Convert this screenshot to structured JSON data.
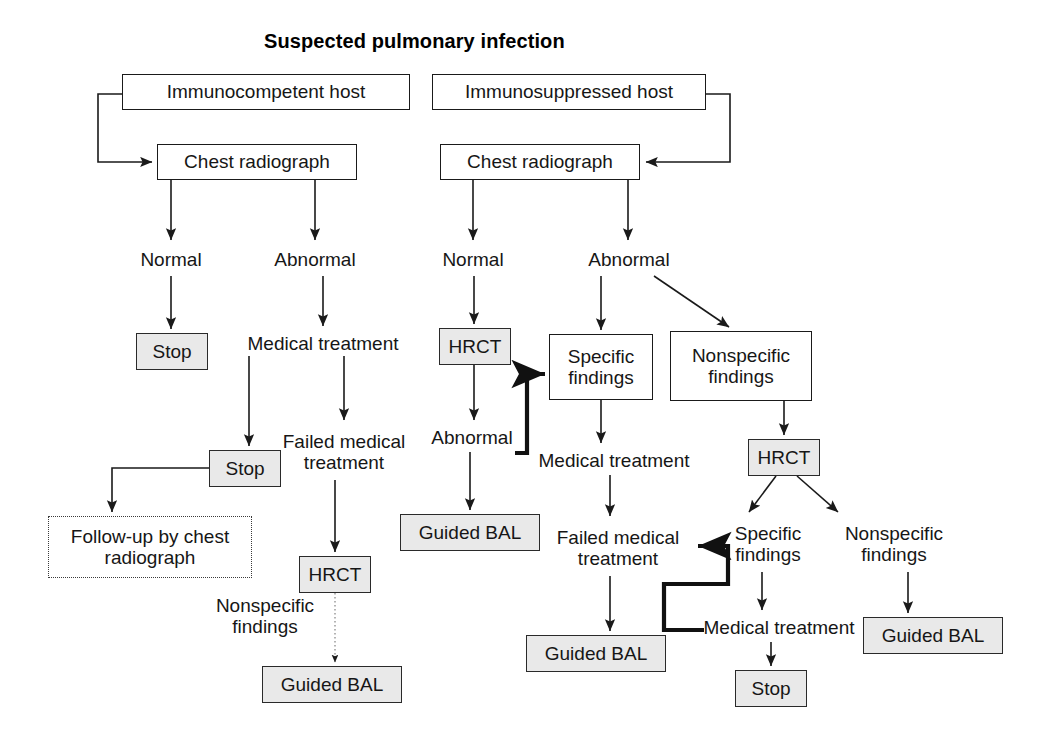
{
  "figure": {
    "title": "Suspected pulmonary infection",
    "type": "flowchart"
  },
  "colors": {
    "shaded_fill": "#e9e9e9",
    "plain_fill": "#ffffff",
    "stroke": "#1a1a1a",
    "text": "#161616"
  },
  "nodes": [
    {
      "id": "n01",
      "label": "Immunocompetent host",
      "style": "plain",
      "x": 122,
      "y": 74,
      "w": 288,
      "h": 36,
      "fs": 19
    },
    {
      "id": "n02",
      "label": "Immunosuppressed host",
      "style": "plain",
      "x": 432,
      "y": 74,
      "w": 274,
      "h": 36,
      "fs": 19
    },
    {
      "id": "n03",
      "label": "Chest radiograph",
      "style": "plain",
      "x": 157,
      "y": 144,
      "w": 200,
      "h": 36,
      "fs": 19
    },
    {
      "id": "n04",
      "label": "Chest radiograph",
      "style": "plain",
      "x": 440,
      "y": 144,
      "w": 200,
      "h": 36,
      "fs": 19
    },
    {
      "id": "n05",
      "label": "Normal",
      "style": "text",
      "x": 125,
      "y": 246,
      "w": 92,
      "h": 28,
      "fs": 19
    },
    {
      "id": "n06",
      "label": "Abnormal",
      "style": "text",
      "x": 260,
      "y": 246,
      "w": 110,
      "h": 28,
      "fs": 19
    },
    {
      "id": "n07",
      "label": "Normal",
      "style": "text",
      "x": 427,
      "y": 246,
      "w": 92,
      "h": 28,
      "fs": 19
    },
    {
      "id": "n08",
      "label": "Abnormal",
      "style": "text",
      "x": 574,
      "y": 246,
      "w": 110,
      "h": 28,
      "fs": 19
    },
    {
      "id": "n09",
      "label": "Stop",
      "style": "shaded",
      "x": 136,
      "y": 333,
      "w": 72,
      "h": 37,
      "fs": 19
    },
    {
      "id": "n10",
      "label": "Medical treatment",
      "style": "text",
      "x": 228,
      "y": 330,
      "w": 190,
      "h": 28,
      "fs": 19
    },
    {
      "id": "n11",
      "label": "HRCT",
      "style": "shaded",
      "x": 439,
      "y": 328,
      "w": 72,
      "h": 37,
      "fs": 19
    },
    {
      "id": "n12",
      "label": "Specific\nfindings",
      "style": "plain",
      "x": 549,
      "y": 334,
      "w": 104,
      "h": 66,
      "fs": 19
    },
    {
      "id": "n13",
      "label": "Nonspecific\nfindings",
      "style": "plain",
      "x": 670,
      "y": 331,
      "w": 142,
      "h": 70,
      "fs": 19
    },
    {
      "id": "n14",
      "label": "Stop",
      "style": "shaded",
      "x": 209,
      "y": 450,
      "w": 72,
      "h": 37,
      "fs": 19
    },
    {
      "id": "n15",
      "label": "Failed medical\ntreatment",
      "style": "text",
      "x": 274,
      "y": 424,
      "w": 140,
      "h": 56,
      "fs": 19
    },
    {
      "id": "n16",
      "label": "Abnormal",
      "style": "text",
      "x": 417,
      "y": 424,
      "w": 110,
      "h": 28,
      "fs": 19
    },
    {
      "id": "n17",
      "label": "Medical treatment",
      "style": "text",
      "x": 519,
      "y": 447,
      "w": 190,
      "h": 28,
      "fs": 19
    },
    {
      "id": "n18",
      "label": "HRCT",
      "style": "shaded",
      "x": 748,
      "y": 439,
      "w": 72,
      "h": 37,
      "fs": 19
    },
    {
      "id": "n19",
      "label": "Follow-up by chest\nradiograph",
      "style": "dotted",
      "x": 48,
      "y": 516,
      "w": 204,
      "h": 62,
      "fs": 19
    },
    {
      "id": "n20",
      "label": "Guided BAL",
      "style": "shaded",
      "x": 400,
      "y": 514,
      "w": 140,
      "h": 37,
      "fs": 19
    },
    {
      "id": "n21",
      "label": "Failed medical\ntreatment",
      "style": "text",
      "x": 548,
      "y": 520,
      "w": 140,
      "h": 56,
      "fs": 19
    },
    {
      "id": "n22",
      "label": "Specific\nfindings",
      "style": "text",
      "x": 716,
      "y": 516,
      "w": 104,
      "h": 56,
      "fs": 19
    },
    {
      "id": "n23",
      "label": "Nonspecific\nfindings",
      "style": "text",
      "x": 828,
      "y": 516,
      "w": 132,
      "h": 56,
      "fs": 19
    },
    {
      "id": "n24",
      "label": "HRCT",
      "style": "shaded",
      "x": 299,
      "y": 556,
      "w": 72,
      "h": 37,
      "fs": 19
    },
    {
      "id": "n25",
      "label": "Nonspecific\nfindings",
      "style": "text",
      "x": 205,
      "y": 588,
      "w": 120,
      "h": 56,
      "fs": 19
    },
    {
      "id": "n26",
      "label": "Medical treatment",
      "style": "text",
      "x": 693,
      "y": 614,
      "w": 172,
      "h": 28,
      "fs": 19
    },
    {
      "id": "n27",
      "label": "Guided BAL",
      "style": "shaded",
      "x": 863,
      "y": 617,
      "w": 140,
      "h": 37,
      "fs": 19
    },
    {
      "id": "n28",
      "label": "Guided BAL",
      "style": "shaded",
      "x": 526,
      "y": 635,
      "w": 140,
      "h": 37,
      "fs": 19
    },
    {
      "id": "n29",
      "label": "Guided BAL",
      "style": "shaded",
      "x": 262,
      "y": 666,
      "w": 140,
      "h": 37,
      "fs": 19
    },
    {
      "id": "n30",
      "label": "Stop",
      "style": "shaded",
      "x": 735,
      "y": 670,
      "w": 72,
      "h": 37,
      "fs": 19
    }
  ],
  "flow_text": {
    "branch_immunocompetent": [
      "Immunocompetent host",
      "Chest radiograph",
      "Normal",
      "Stop",
      "Follow-up by chest radiograph",
      "Abnormal",
      "Medical treatment",
      "Stop",
      "Failed medical treatment",
      "HRCT",
      "Nonspecific findings",
      "Guided BAL"
    ],
    "branch_immunosuppressed": [
      "Immunosuppressed host",
      "Chest radiograph",
      "Normal",
      "HRCT",
      "Abnormal",
      "Guided BAL",
      "Specific findings",
      "Medical treatment",
      "Failed medical treatment",
      "Guided BAL",
      "Nonspecific findings",
      "HRCT",
      "Specific findings",
      "Medical treatment",
      "Stop",
      "Nonspecific findings",
      "Guided BAL"
    ]
  }
}
